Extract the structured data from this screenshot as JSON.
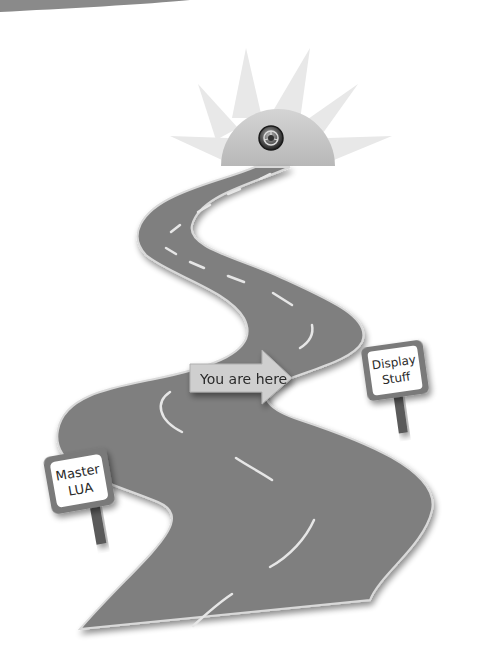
{
  "illustration": {
    "title": "Roadmap",
    "colors": {
      "background": "#ffffff",
      "road": "#7f7f7f",
      "road_edge": "#d9d9d9",
      "lane_marking": "#e6e6e6",
      "sun_rays": "#e8e8e8",
      "sun_dome": "#c9c9c9",
      "sign_frame": "#7a7a7a",
      "sign_face": "#ffffff",
      "sign_post": "#5a5a5a",
      "arrow_fill": "#cfcfcf",
      "text": "#2a2a2a",
      "top_banner": "#8a8a8a"
    },
    "goal": {
      "icon": "steering-wheel-icon",
      "description": "Sun with steering wheel at the end of the road"
    },
    "marker": {
      "label": "You are here",
      "icon": "arrow-right-icon"
    },
    "signs": [
      {
        "id": "display",
        "line1": "Display",
        "line2": "Stuff"
      },
      {
        "id": "master",
        "line1": "Master",
        "line2": "LUA"
      }
    ]
  }
}
